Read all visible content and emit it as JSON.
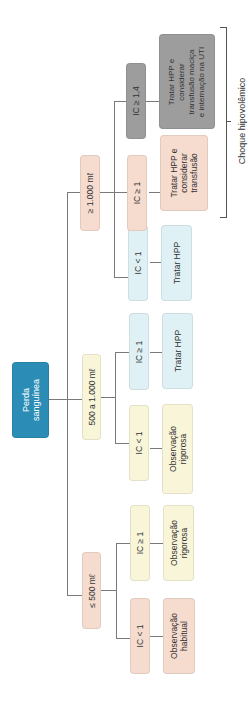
{
  "root": {
    "label": "Perda\nsanguínea",
    "color": "#2b8db5"
  },
  "level1": [
    {
      "label": "≤ 500 mℓ",
      "color": "#f6dccf"
    },
    {
      "label": "500 a 1.000 mℓ",
      "color": "#f8f5d8"
    },
    {
      "label": "≥ 1.000 mℓ",
      "color": "#f6dccf"
    }
  ],
  "criteria": [
    {
      "label": "IC < 1",
      "color": "#f6dccf"
    },
    {
      "label": "IC ≥ 1",
      "color": "#f8f5d8"
    },
    {
      "label": "IC < 1",
      "color": "#f8f5d8"
    },
    {
      "label": "IC ≥ 1",
      "color": "#dff1f4"
    },
    {
      "label": "IC < 1",
      "color": "#dff1f4"
    },
    {
      "label": "IC ≥ 1",
      "color": "#f6dccf"
    },
    {
      "label": "IC ≥ 1,4",
      "color": "#9d9d9d"
    }
  ],
  "actions": [
    {
      "label": "Observação\nhabitual"
    },
    {
      "label": "Observação\nrigorosa"
    },
    {
      "label": "Observação\nrigorosa"
    },
    {
      "label": "Tratar HPP"
    },
    {
      "label": "Tratar HPP"
    },
    {
      "label": "Tratar HPP e\nconsiderar\ntransfusão"
    },
    {
      "label": "Tratar HPP e\nconsiderar\ntransfusão maciça\ne internação na UTI"
    }
  ],
  "bracket": {
    "label": "Choque hipovolêmico"
  }
}
